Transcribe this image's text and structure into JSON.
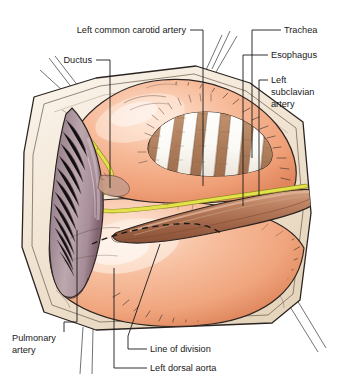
{
  "figure": {
    "type": "anatomical-illustration",
    "background_color": "#ffffff"
  },
  "labels": [
    {
      "id": "left-common-carotid-artery",
      "text": "Left common carotid artery",
      "align": "right",
      "x": 186,
      "y": 33
    },
    {
      "id": "trachea",
      "text": "Trachea",
      "align": "left",
      "x": 284,
      "y": 33
    },
    {
      "id": "ductus",
      "text": "Ductus",
      "align": "right",
      "x": 92,
      "y": 63
    },
    {
      "id": "esophagus",
      "text": "Esophagus",
      "align": "left",
      "x": 271,
      "y": 58
    },
    {
      "id": "left-subclavian-artery-line1",
      "text": "Left",
      "align": "left",
      "x": 271,
      "y": 83
    },
    {
      "id": "left-subclavian-artery-line2",
      "text": "subclavian",
      "align": "left",
      "x": 271,
      "y": 95
    },
    {
      "id": "left-subclavian-artery-line3",
      "text": "artery",
      "align": "left",
      "x": 271,
      "y": 107
    },
    {
      "id": "pulmonary-artery-line1",
      "text": "Pulmonary",
      "align": "left",
      "x": 12,
      "y": 341
    },
    {
      "id": "pulmonary-artery-line2",
      "text": "artery",
      "align": "left",
      "x": 12,
      "y": 353
    },
    {
      "id": "line-of-division",
      "text": "Line of division",
      "align": "left",
      "x": 150,
      "y": 352
    },
    {
      "id": "left-dorsal-aorta",
      "text": "Left dorsal aorta",
      "align": "left",
      "x": 150,
      "y": 371
    }
  ],
  "structures": [
    {
      "id": "aortic-arch",
      "name": "aortic arch",
      "color": "#f0a882"
    },
    {
      "id": "trachea-body",
      "name": "trachea with cartilage rings",
      "color": "#ffffff"
    },
    {
      "id": "tracheal-ring-interval",
      "name": "tracheal ring interval",
      "color": "#b78a6a"
    },
    {
      "id": "esophagus-body",
      "name": "esophagus",
      "color": "#b5775a"
    },
    {
      "id": "pulmonary-artery-body",
      "name": "pulmonary artery",
      "color": "#a08a95"
    },
    {
      "id": "vagus-nerve",
      "name": "vagus and recurrent laryngeal nerve",
      "color": "#e3e24a"
    },
    {
      "id": "pericardium",
      "name": "retracted pericardium",
      "color": "#f2e6d6"
    },
    {
      "id": "line-of-division-marker",
      "name": "dashed line of division",
      "color": "#181818"
    }
  ],
  "colors": {
    "tissue_light": "#f6c6ab",
    "tissue_mid": "#f0a882",
    "tissue_deep": "#e08a63",
    "pericardium": "#f2e6d6",
    "pericardium_shadow": "#e2d3bd",
    "nerve_yellow": "#e3e24a",
    "nerve_outline": "#8f8a22",
    "vessel_purple": "#a08a95",
    "vessel_purple_deep": "#7e6472",
    "esophagus_brown": "#b5775a",
    "cartilage_white": "#fdfdfb",
    "outline": "#2b2420",
    "text": "#1a1a1a"
  }
}
